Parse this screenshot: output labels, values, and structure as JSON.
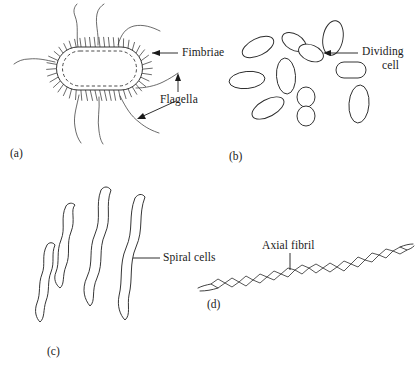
{
  "figure": {
    "background_color": "#ffffff",
    "ink_color": "#2b2b2b",
    "width": 416,
    "height": 370
  },
  "panels": [
    {
      "id": "a",
      "letter": "(a)",
      "subject": "rod-shaped bacterium with fimbriae and flagella",
      "labels": [
        "Fimbriae",
        "Flagella"
      ]
    },
    {
      "id": "b",
      "letter": "(b)",
      "subject": "field of rod-shaped bacteria including dividing cells",
      "labels": [
        "Dividing cell"
      ],
      "cell_count": 10
    },
    {
      "id": "c",
      "letter": "(c)",
      "subject": "spiral-shaped bacteria",
      "labels": [
        "Spiral cells"
      ],
      "cell_count": 4
    },
    {
      "id": "d",
      "letter": "(d)",
      "subject": "spirochete with axial fibril",
      "labels": [
        "Axial fibril"
      ]
    }
  ],
  "annotations": {
    "fimbriae": {
      "text": "Fimbriae",
      "panel": "a"
    },
    "flagella": {
      "text": "Flagella",
      "panel": "a"
    },
    "dividing_cell": {
      "text_line1": "Dividing",
      "text_line2": "cell",
      "panel": "b"
    },
    "spiral_cells": {
      "text": "Spiral cells",
      "panel": "c"
    },
    "axial_fibril": {
      "text": "Axial fibril",
      "panel": "d"
    }
  },
  "panel_letters": {
    "a": "(a)",
    "b": "(b)",
    "c": "(c)",
    "d": "(d)"
  }
}
